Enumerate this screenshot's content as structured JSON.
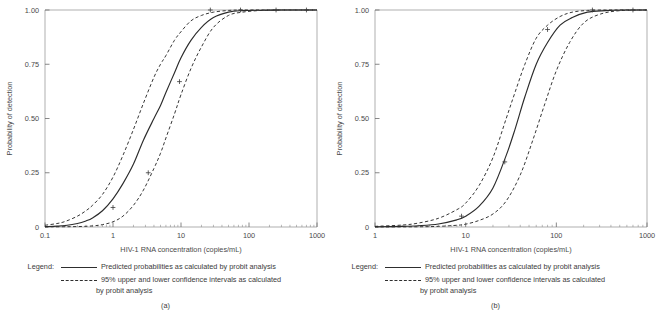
{
  "figure": {
    "panels": [
      {
        "caption": "(a)",
        "legend": {
          "label": "Legend:",
          "solid_text": "Predicted probabilities as calculated by probit analysis",
          "dashed_text": "95% upper and lower confidence intervals as calculated",
          "dashed_text_cont": "by probit analysis"
        },
        "chart_data": {
          "type": "line",
          "title": "",
          "xlabel": "HIV-1 RNA concentration (copies/mL)",
          "ylabel": "Probability of detection",
          "xscale": "log",
          "xlim": [
            0.1,
            1000
          ],
          "ylim": [
            0,
            1
          ],
          "xticks": [
            0.1,
            1,
            10,
            100,
            1000
          ],
          "xticklabels": [
            "0.1",
            "1",
            "10",
            "100",
            "1000"
          ],
          "yticks": [
            0,
            0.25,
            0.5,
            0.75,
            1
          ],
          "yticklabels": [
            "0",
            "0.25",
            "0.50",
            "0.75",
            "1.00"
          ],
          "grid": false,
          "legend_position": "below-plot",
          "series": [
            {
              "name": "Predicted probabilities as calculated by probit analysis",
              "style": "solid",
              "x": [
                0.1,
                0.15,
                0.2,
                0.3,
                0.4,
                0.5,
                0.7,
                1.0,
                1.4,
                2.0,
                2.8,
                4.0,
                5.0,
                6.0,
                8.0,
                10.0,
                14.0,
                20.0,
                30.0,
                50.0,
                80.0,
                150.0,
                300.0,
                600.0,
                1000.0
              ],
              "y": [
                0.002,
                0.004,
                0.007,
                0.016,
                0.028,
                0.042,
                0.075,
                0.13,
                0.2,
                0.29,
                0.4,
                0.5,
                0.56,
                0.62,
                0.71,
                0.78,
                0.86,
                0.92,
                0.965,
                0.99,
                0.997,
                0.999,
                1.0,
                1.0,
                1.0
              ]
            },
            {
              "name": "95% upper confidence interval",
              "style": "dashed",
              "x": [
                0.1,
                0.15,
                0.2,
                0.3,
                0.4,
                0.5,
                0.7,
                1.0,
                1.4,
                2.0,
                2.8,
                4.0,
                5.0,
                6.0,
                8.0,
                10.0,
                14.0,
                20.0,
                30.0,
                50.0,
                80.0,
                150.0,
                300.0,
                600.0,
                1000.0
              ],
              "y": [
                0.008,
                0.016,
                0.026,
                0.05,
                0.075,
                0.1,
                0.15,
                0.23,
                0.33,
                0.45,
                0.57,
                0.69,
                0.75,
                0.79,
                0.86,
                0.9,
                0.95,
                0.975,
                0.99,
                0.998,
                1.0,
                1.0,
                1.0,
                1.0,
                1.0
              ]
            },
            {
              "name": "95% lower confidence interval",
              "style": "dashed",
              "x": [
                0.1,
                0.3,
                0.5,
                0.7,
                1.0,
                1.4,
                2.0,
                2.8,
                4.0,
                5.0,
                6.0,
                8.0,
                10.0,
                14.0,
                20.0,
                30.0,
                50.0,
                80.0,
                150.0,
                300.0,
                600.0,
                1000.0
              ],
              "y": [
                0.0005,
                0.002,
                0.005,
                0.011,
                0.024,
                0.05,
                0.1,
                0.17,
                0.27,
                0.34,
                0.41,
                0.52,
                0.61,
                0.73,
                0.83,
                0.92,
                0.975,
                0.99,
                0.998,
                1.0,
                1.0,
                1.0
              ]
            }
          ],
          "markers": [
            {
              "x": 1.0,
              "y": 0.09
            },
            {
              "x": 3.3,
              "y": 0.25
            },
            {
              "x": 9.5,
              "y": 0.67
            },
            {
              "x": 27.0,
              "y": 1.0
            },
            {
              "x": 75.0,
              "y": 1.0
            },
            {
              "x": 250.0,
              "y": 1.0
            },
            {
              "x": 700.0,
              "y": 1.0
            }
          ]
        }
      },
      {
        "caption": "(b)",
        "legend": {
          "label": "Legend:",
          "solid_text": "Predicted probabilities as calculated by probit analysis",
          "dashed_text": "95% upper and lower confidence intervals as calculated",
          "dashed_text_cont": "by probit analysis"
        },
        "chart_data": {
          "type": "line",
          "title": "",
          "xlabel": "HIV-1 RNA concentration (copies/mL)",
          "ylabel": "Probability of detection",
          "xscale": "log",
          "xlim": [
            1,
            1000
          ],
          "ylim": [
            0,
            1
          ],
          "xticks": [
            1,
            10,
            100,
            1000
          ],
          "xticklabels": [
            "1",
            "10",
            "100",
            "1000"
          ],
          "yticks": [
            0,
            0.25,
            0.5,
            0.75,
            1
          ],
          "yticklabels": [
            "0",
            "0.25",
            "0.50",
            "0.75",
            "1.00"
          ],
          "grid": false,
          "legend_position": "below-plot",
          "series": [
            {
              "name": "Predicted probabilities as calculated by probit analysis",
              "style": "solid",
              "x": [
                1.0,
                2.0,
                3.0,
                5.0,
                8.0,
                10.0,
                14.0,
                20.0,
                28.0,
                35.0,
                45.0,
                60.0,
                80.0,
                110.0,
                150.0,
                220.0,
                350.0,
                550.0,
                1000.0
              ],
              "y": [
                0.001,
                0.003,
                0.006,
                0.014,
                0.033,
                0.05,
                0.095,
                0.18,
                0.33,
                0.45,
                0.6,
                0.75,
                0.85,
                0.93,
                0.965,
                0.99,
                0.997,
                1.0,
                1.0
              ]
            },
            {
              "name": "95% upper confidence interval",
              "style": "dashed",
              "x": [
                1.0,
                2.0,
                3.0,
                5.0,
                8.0,
                10.0,
                14.0,
                20.0,
                28.0,
                35.0,
                45.0,
                60.0,
                80.0,
                110.0,
                150.0,
                220.0,
                350.0,
                550.0,
                1000.0
              ],
              "y": [
                0.003,
                0.009,
                0.018,
                0.04,
                0.08,
                0.11,
                0.19,
                0.32,
                0.5,
                0.62,
                0.75,
                0.87,
                0.93,
                0.97,
                0.99,
                0.998,
                1.0,
                1.0,
                1.0
              ]
            },
            {
              "name": "95% lower confidence interval",
              "style": "dashed",
              "x": [
                1.0,
                3.0,
                5.0,
                8.0,
                10.0,
                14.0,
                20.0,
                28.0,
                40.0,
                55.0,
                75.0,
                100.0,
                140.0,
                200.0,
                300.0,
                500.0,
                1000.0
              ],
              "y": [
                0.0002,
                0.001,
                0.003,
                0.008,
                0.013,
                0.03,
                0.06,
                0.12,
                0.24,
                0.4,
                0.57,
                0.72,
                0.85,
                0.94,
                0.98,
                0.997,
                1.0
              ]
            }
          ],
          "markers": [
            {
              "x": 9.0,
              "y": 0.05
            },
            {
              "x": 27.0,
              "y": 0.3
            },
            {
              "x": 80.0,
              "y": 0.91
            },
            {
              "x": 250.0,
              "y": 1.0
            },
            {
              "x": 700.0,
              "y": 1.0
            }
          ]
        }
      }
    ]
  }
}
